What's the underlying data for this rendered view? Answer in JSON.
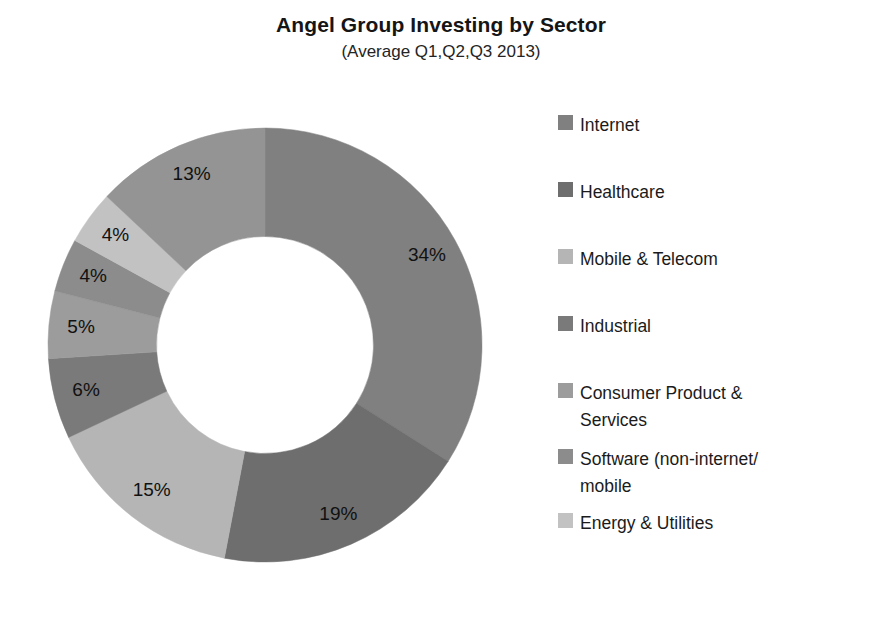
{
  "header": {
    "title": "Angel Group Investing by Sector",
    "subtitle": "(Average Q1,Q2,Q3 2013)"
  },
  "legend": {
    "position": "right",
    "items": [
      {
        "label": "Internet",
        "color": "#808080"
      },
      {
        "label": "Healthcare",
        "color": "#6e6e6e"
      },
      {
        "label": "Mobile & Telecom",
        "color": "#b5b5b5"
      },
      {
        "label": "Industrial",
        "color": "#7a7a7a"
      },
      {
        "label": "Consumer Product &\nServices",
        "color": "#9c9c9c"
      },
      {
        "label": "Software (non-internet/\nmobile",
        "color": "#8c8c8c"
      },
      {
        "label": "Energy & Utilities",
        "color": "#c2c2c2"
      }
    ]
  },
  "chart_data": {
    "type": "pie",
    "variant": "donut",
    "title": "Angel Group Investing by Sector",
    "subtitle": "(Average Q1,Q2,Q3 2013)",
    "xlabel": "",
    "ylabel": "",
    "units": "percent",
    "start_angle_deg": 0,
    "direction": "clockwise",
    "hole_ratio": 0.5,
    "categories": [
      "Internet",
      "Healthcare",
      "Mobile & Telecom",
      "Industrial",
      "Consumer Product & Services",
      "Software (non-internet/mobile",
      "Energy & Utilities",
      "Other"
    ],
    "values": [
      34,
      19,
      15,
      6,
      5,
      4,
      4,
      13
    ],
    "data_labels": [
      "34%",
      "19%",
      "15%",
      "6%",
      "5%",
      "4%",
      "4%",
      "13%"
    ],
    "colors": [
      "#808080",
      "#6e6e6e",
      "#b5b5b5",
      "#7a7a7a",
      "#9c9c9c",
      "#8c8c8c",
      "#c2c2c2",
      "#949494"
    ],
    "legend": [
      "Internet",
      "Healthcare",
      "Mobile & Telecom",
      "Industrial",
      "Consumer Product & Services",
      "Software (non-internet/mobile",
      "Energy & Utilities"
    ],
    "grid": false
  }
}
